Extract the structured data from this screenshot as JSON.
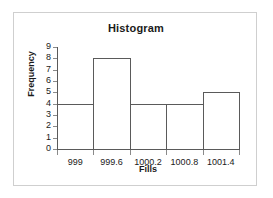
{
  "chart_data": {
    "type": "bar",
    "title": "Histogram",
    "xlabel": "Fills",
    "ylabel": "Frequency",
    "categories": [
      "999",
      "999.6",
      "1000.2",
      "1000.8",
      "1001.4"
    ],
    "values": [
      4,
      8,
      4,
      4,
      5
    ],
    "ylim": [
      0,
      9
    ],
    "yticks": [
      "0",
      "1",
      "2",
      "3",
      "4",
      "5",
      "6",
      "7",
      "8",
      "9"
    ],
    "grid": false,
    "legend": "none",
    "bar_style": {
      "fill": "none",
      "outline_color": "#5a5a5a"
    },
    "frame_color": "#cfcfcf",
    "axis_color": "#5a5a5a",
    "text_color": "#1a1a1a"
  }
}
